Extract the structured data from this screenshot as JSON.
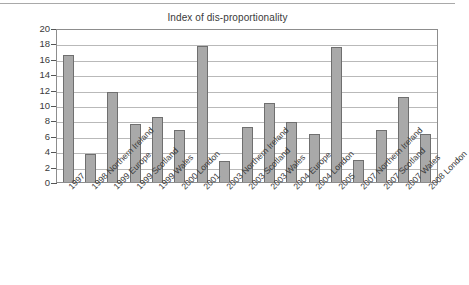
{
  "chart_data": {
    "type": "bar",
    "title": "Index of dis-proportionality",
    "xlabel": "",
    "ylabel": "",
    "ylim": [
      0,
      20
    ],
    "ytick_step": 2,
    "yticks": [
      "20",
      "18",
      "16",
      "14",
      "12",
      "10",
      "8",
      "6",
      "4",
      "2",
      "0"
    ],
    "grid": true,
    "legend": "none",
    "bar_color": "#a9a9a9",
    "bar_border_color": "#6f6f6f",
    "gridline_color": "#b9b9b9",
    "axis_color": "#555555",
    "categories": [
      "1997",
      "1998 Northern Ireland",
      "1999 Europe",
      "1999 Scotland",
      "1999 Wales",
      "2000 London",
      "2001",
      "2003 Northern Ireland",
      "2003 Scotland",
      "2003 Wales",
      "2004 Europe",
      "2004 London",
      "2005",
      "2007 Northern Ireland",
      "2007 Scotland",
      "2007 Wales",
      "2008 London"
    ],
    "values": [
      16.5,
      3.6,
      11.65,
      7.5,
      8.5,
      6.75,
      17.7,
      2.75,
      7.15,
      10.2,
      7.85,
      6.3,
      17.5,
      2.85,
      6.75,
      11.1,
      6.2
    ]
  }
}
